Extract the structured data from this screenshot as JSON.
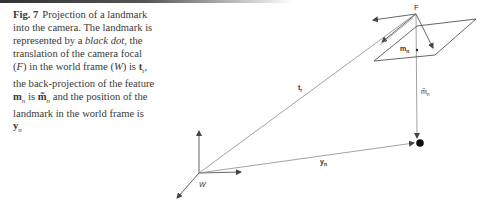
{
  "figure": {
    "label": "Fig. 7",
    "caption_parts": {
      "p1": "Projection of a landmark into the camera. The landmark is represented by a ",
      "p2_italic": "black dot",
      "p3": ", the translation of the camera focal (",
      "p4_italic": "F",
      "p5": ") in the world frame (",
      "p6_italic": "W",
      "p7": ") is ",
      "p8_bold": "t",
      "p8_sub": "r",
      "p9": ", the back-projection of the feature ",
      "p10_bold": "m",
      "p10_sub": "n",
      "p11": " is ",
      "p12_bold": "m̃",
      "p12_sub": "n",
      "p13": " and the position of the landmark in the world frame is ",
      "p14_bold": "y",
      "p14_sub": "n"
    }
  },
  "diagram": {
    "labels": {
      "focal": "F",
      "world": "W",
      "translation": "t",
      "translation_sub": "r",
      "feature": "m",
      "feature_sub": "n",
      "backprojection": "m̃",
      "backprojection_sub": "n",
      "landmark_position": "y",
      "landmark_position_sub": "n"
    },
    "colors": {
      "line": "#8a8a8a",
      "arrow": "#444444",
      "landmark": "#111111"
    }
  }
}
